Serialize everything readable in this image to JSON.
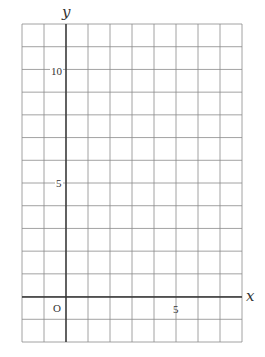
{
  "chart_data": {
    "type": "grid",
    "title": "",
    "xlabel": "x",
    "ylabel": "y",
    "xlim": [
      -2,
      8
    ],
    "ylim": [
      -2,
      12
    ],
    "grid": true,
    "grid_step": 1,
    "origin_label": "O",
    "x_ticks_labeled": [
      {
        "value": 5,
        "label": "5"
      }
    ],
    "y_ticks_labeled": [
      {
        "value": 5,
        "label": "5"
      },
      {
        "value": 10,
        "label": "10"
      }
    ],
    "series": []
  },
  "labels": {
    "x_axis": "x",
    "y_axis": "y",
    "origin": "O",
    "x_tick_5": "5",
    "y_tick_5": "5",
    "y_tick_10": "10"
  },
  "colors": {
    "grid": "#8a8a8a",
    "axis": "#333333"
  }
}
